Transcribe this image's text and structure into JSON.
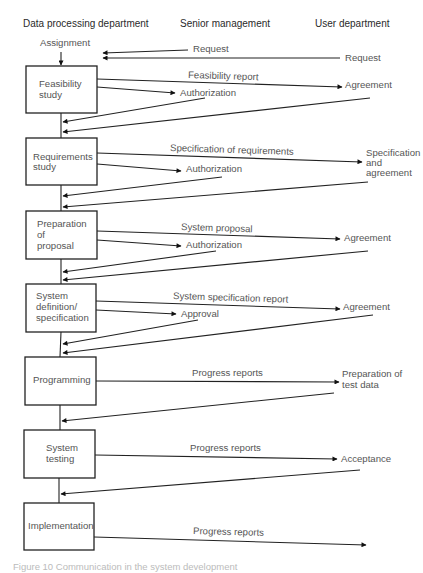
{
  "columns": {
    "dp": "Data processing department",
    "senior": "Senior management",
    "user": "User department"
  },
  "start": {
    "assignment": "Assignment",
    "request_senior": "Request",
    "request_user": "Request"
  },
  "stages": [
    {
      "line1": "Feasibility",
      "line2": "study",
      "line3": "",
      "to_user": "Feasibility report",
      "to_senior": "Authorization",
      "user_reply": [
        "Agreement"
      ]
    },
    {
      "line1": "Requirements",
      "line2": "study",
      "line3": "",
      "to_user": "Specification of requirements",
      "to_senior": "Authorization",
      "user_reply": [
        "Specification",
        "and",
        "agreement"
      ]
    },
    {
      "line1": "Preparation",
      "line2": "of",
      "line3": "proposal",
      "to_user": "System proposal",
      "to_senior": "Authorization",
      "user_reply": [
        "Agreement"
      ]
    },
    {
      "line1": "System",
      "line2": "definition/",
      "line3": "specification",
      "to_user": "System specification report",
      "to_senior": "Approval",
      "user_reply": [
        "Agreement"
      ]
    },
    {
      "line1": "Programming",
      "line2": "",
      "line3": "",
      "to_user": "Progress reports",
      "to_senior": "",
      "user_reply": [
        "Preparation of",
        "test data"
      ]
    },
    {
      "line1": "System",
      "line2": "testing",
      "line3": "",
      "to_user": "Progress reports",
      "to_senior": "",
      "user_reply": [
        "Acceptance"
      ]
    },
    {
      "line1": "Implementation",
      "line2": "",
      "line3": "",
      "to_user": "Progress reports",
      "to_senior": "",
      "user_reply": []
    }
  ],
  "caption": "Figure 10   Communication in the system development"
}
